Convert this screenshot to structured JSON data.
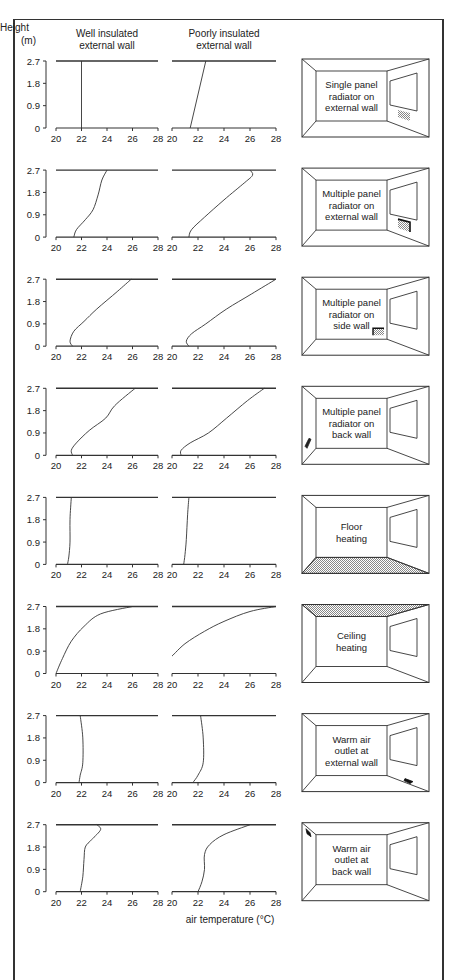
{
  "header": {
    "y_label_line1": "Height",
    "y_label_line2": "(m)",
    "col1_line1": "Well insulated",
    "col1_line2": "external wall",
    "col2_line1": "Poorly insulated",
    "col2_line2": "external wall"
  },
  "x_axis_label": "air temperature (°C)",
  "y_ticks": [
    "0",
    "0.9",
    "1.8",
    "2.7"
  ],
  "x_ticks": [
    "20",
    "22",
    "24",
    "26",
    "28"
  ],
  "colors": {
    "line": "#333333",
    "hatch": "#888888",
    "text": "#222222"
  },
  "chart_data": {
    "type": "line",
    "title": "",
    "xlabel": "air temperature (°C)",
    "ylabel": "Height (m)",
    "xlim": [
      20,
      28
    ],
    "ylim": [
      0,
      2.7
    ],
    "grid": false,
    "columns": [
      "Well insulated external wall",
      "Poorly insulated external wall"
    ],
    "rows": [
      {
        "label": "Single panel radiator on external wall",
        "label_lines": [
          "Single panel",
          "radiator on",
          "external wall"
        ],
        "heat_source": "radiator-under-window",
        "well": [
          [
            22.0,
            0
          ],
          [
            22.0,
            2.7
          ]
        ],
        "poor": [
          [
            21.4,
            0
          ],
          [
            22.6,
            2.7
          ]
        ]
      },
      {
        "label": "Multiple panel radiator on external wall",
        "label_lines": [
          "Multiple panel",
          "radiator on",
          "external wall"
        ],
        "heat_source": "multi-radiator-under-window",
        "well": [
          [
            21.4,
            0
          ],
          [
            21.6,
            0.3
          ],
          [
            22.3,
            0.7
          ],
          [
            22.9,
            1.1
          ],
          [
            23.3,
            1.7
          ],
          [
            23.6,
            2.3
          ],
          [
            24.0,
            2.7
          ]
        ],
        "poor": [
          [
            21.3,
            0
          ],
          [
            21.5,
            0.3
          ],
          [
            22.5,
            0.8
          ],
          [
            24.0,
            1.5
          ],
          [
            25.6,
            2.2
          ],
          [
            26.2,
            2.5
          ],
          [
            26.0,
            2.7
          ]
        ]
      },
      {
        "label": "Multiple panel radiator on side wall",
        "label_lines": [
          "Multiple panel",
          "radiator on",
          "side wall"
        ],
        "heat_source": "radiator-side-wall",
        "well": [
          [
            21.3,
            0
          ],
          [
            21.1,
            0.2
          ],
          [
            21.4,
            0.6
          ],
          [
            22.2,
            1.0
          ],
          [
            23.2,
            1.5
          ],
          [
            24.8,
            2.2
          ],
          [
            25.9,
            2.7
          ]
        ],
        "poor": [
          [
            21.3,
            0
          ],
          [
            21.1,
            0.2
          ],
          [
            21.5,
            0.5
          ],
          [
            22.6,
            0.9
          ],
          [
            24.2,
            1.5
          ],
          [
            26.1,
            2.1
          ],
          [
            28.0,
            2.7
          ]
        ]
      },
      {
        "label": "Multiple panel radiator on back wall",
        "label_lines": [
          "Multiple panel",
          "radiator on",
          "back wall"
        ],
        "heat_source": "radiator-back-wall",
        "well": [
          [
            21.3,
            0
          ],
          [
            21.2,
            0.2
          ],
          [
            21.6,
            0.5
          ],
          [
            22.6,
            1.0
          ],
          [
            23.9,
            1.5
          ],
          [
            24.6,
            2.0
          ],
          [
            26.2,
            2.7
          ]
        ],
        "poor": [
          [
            20.7,
            0
          ],
          [
            20.7,
            0.2
          ],
          [
            21.4,
            0.5
          ],
          [
            22.8,
            0.9
          ],
          [
            24.2,
            1.5
          ],
          [
            25.8,
            2.2
          ],
          [
            27.1,
            2.7
          ]
        ]
      },
      {
        "label": "Floor heating",
        "label_lines": [
          "Floor",
          "heating"
        ],
        "heat_source": "floor",
        "well": [
          [
            20.9,
            0
          ],
          [
            21.0,
            0.3
          ],
          [
            21.1,
            0.9
          ],
          [
            21.1,
            1.8
          ],
          [
            21.2,
            2.7
          ]
        ],
        "poor": [
          [
            20.9,
            0
          ],
          [
            21.0,
            0.4
          ],
          [
            21.1,
            1.0
          ],
          [
            21.2,
            2.0
          ],
          [
            21.3,
            2.7
          ]
        ]
      },
      {
        "label": "Ceiling heating",
        "label_lines": [
          "Ceiling",
          "heating"
        ],
        "heat_source": "ceiling",
        "well": [
          [
            20.0,
            0
          ],
          [
            20.5,
            0.6
          ],
          [
            21.2,
            1.3
          ],
          [
            22.2,
            1.9
          ],
          [
            23.5,
            2.4
          ],
          [
            26.0,
            2.7
          ]
        ],
        "poor": [
          [
            20.0,
            0.7
          ],
          [
            21.0,
            1.2
          ],
          [
            22.5,
            1.7
          ],
          [
            24.0,
            2.1
          ],
          [
            26.0,
            2.5
          ],
          [
            28.0,
            2.7
          ]
        ]
      },
      {
        "label": "Warm air outlet at external wall",
        "label_lines": [
          "Warm air",
          "outlet at",
          "external wall"
        ],
        "heat_source": "warm-air-floor-external",
        "well": [
          [
            21.8,
            0
          ],
          [
            21.9,
            0.3
          ],
          [
            22.1,
            0.8
          ],
          [
            22.1,
            1.8
          ],
          [
            21.9,
            2.7
          ]
        ],
        "poor": [
          [
            21.6,
            0
          ],
          [
            22.0,
            0.3
          ],
          [
            22.4,
            0.8
          ],
          [
            22.4,
            1.8
          ],
          [
            22.2,
            2.7
          ]
        ]
      },
      {
        "label": "Warm air outlet at back wall",
        "label_lines": [
          "Warm air",
          "outlet at",
          "back wall"
        ],
        "heat_source": "warm-air-ceiling-back",
        "well": [
          [
            21.9,
            0
          ],
          [
            22.1,
            0.6
          ],
          [
            22.2,
            1.3
          ],
          [
            22.3,
            1.8
          ],
          [
            22.8,
            2.1
          ],
          [
            23.5,
            2.5
          ],
          [
            23.2,
            2.7
          ]
        ],
        "poor": [
          [
            22.0,
            0
          ],
          [
            22.3,
            0.4
          ],
          [
            22.5,
            0.9
          ],
          [
            22.5,
            1.5
          ],
          [
            22.9,
            1.9
          ],
          [
            24.0,
            2.3
          ],
          [
            26.0,
            2.7
          ]
        ]
      }
    ]
  }
}
